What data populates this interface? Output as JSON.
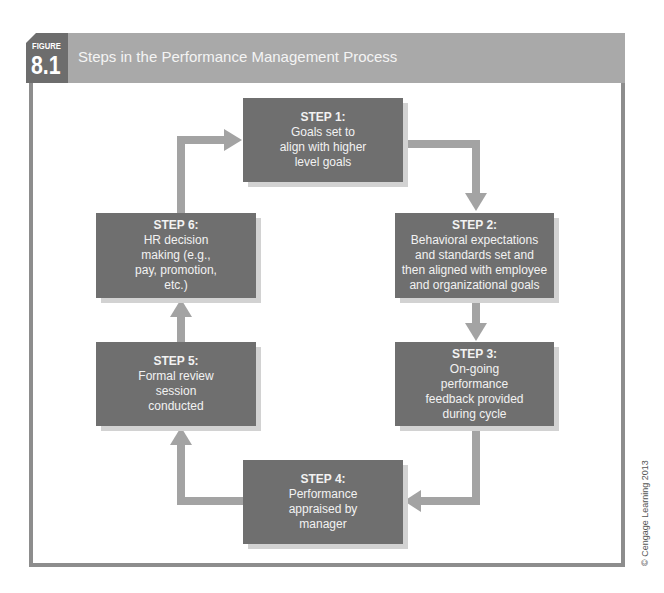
{
  "header": {
    "figure_word": "FIGURE",
    "figure_number": "8.1",
    "title": "Steps in the Performance Management Process"
  },
  "steps": [
    {
      "title": "STEP 1:",
      "description": "Goals set to\nalign with higher\nlevel goals"
    },
    {
      "title": "STEP 2:",
      "description": "Behavioral expectations\nand standards set and\nthen aligned with employee\nand organizational goals"
    },
    {
      "title": "STEP 3:",
      "description": "On-going\nperformance\nfeedback provided\nduring cycle"
    },
    {
      "title": "STEP 4:",
      "description": "Performance\nappraised by\nmanager"
    },
    {
      "title": "STEP 5:",
      "description": "Formal review\nsession\nconducted"
    },
    {
      "title": "STEP 6:",
      "description": "HR decision\nmaking (e.g.,\npay, promotion,\netc.)"
    }
  ],
  "colors": {
    "box_fill": "#6f6f6f",
    "box_shadow": "#d2d2d2",
    "arrow": "#a3a3a3",
    "header_band": "#a9a9a9",
    "figure_label": "#6d6d6d",
    "frame_border": "#8d8d8d"
  },
  "credit": "© Cengage Learning 2013"
}
